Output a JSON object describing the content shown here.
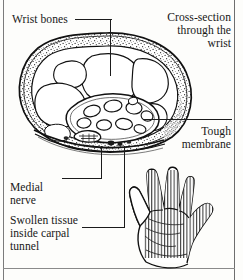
{
  "figure": {
    "type": "anatomical-illustration",
    "clipped_top_text": " ",
    "background_color": "#fdfdfb",
    "ink_color": "#181818",
    "border_color": "#7b7b7b"
  },
  "labels": {
    "wrist_bones": "Wrist bones",
    "cross_section": "Cross-section\nthrough the\nwrist",
    "tough_membrane": "Tough\nmembrane",
    "medial_nerve": "Medial\nnerve",
    "swollen_tissue": "Swollen tissue\ninside carpal\ntunnel"
  },
  "callouts": [
    {
      "name": "wrist-bones",
      "label": "Wrist bones",
      "side": "left",
      "style": "elbow-down"
    },
    {
      "name": "cross-section",
      "label": "Cross-section through the wrist",
      "side": "right",
      "style": "none"
    },
    {
      "name": "tough-membrane",
      "label": "Tough membrane",
      "side": "right",
      "style": "horizontal"
    },
    {
      "name": "medial-nerve",
      "label": "Medial nerve",
      "side": "left",
      "style": "elbow-left"
    },
    {
      "name": "swollen-tissue",
      "label": "Swollen tissue inside carpal tunnel",
      "side": "left",
      "style": "elbow-left"
    }
  ],
  "illustrations": {
    "cross_section": {
      "name": "wrist-cross-section",
      "description": "Oval transverse section of the wrist with stippled soft-tissue ring, carpal bones, and a bundle of tendon ovals inside the carpal tunnel",
      "tendon_count": 9
    },
    "hand": {
      "name": "hand-palm-view",
      "description": "Palm view of a right hand with hatched shading over the thumb, index, middle and ring finger region indicating the area of numbness"
    }
  }
}
